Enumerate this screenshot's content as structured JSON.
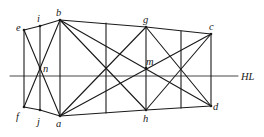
{
  "diagram": {
    "type": "perspective-construction",
    "horizon_line": {
      "label": "HL",
      "y": 76,
      "x1": 10,
      "x2": 238,
      "label_pos": [
        241,
        80
      ]
    },
    "points": {
      "e": [
        24,
        30
      ],
      "i": [
        40,
        26
      ],
      "b": [
        60,
        20
      ],
      "g": [
        146,
        27
      ],
      "c": [
        211,
        34
      ],
      "f": [
        24,
        107
      ],
      "j": [
        40,
        110
      ],
      "a": [
        60,
        116
      ],
      "h": [
        146,
        110
      ],
      "d": [
        211,
        106
      ],
      "n": [
        40,
        68
      ],
      "m": [
        146,
        68
      ]
    },
    "labels": [
      {
        "id": "e",
        "text": "e",
        "x": 16,
        "y": 31
      },
      {
        "id": "i",
        "text": "i",
        "x": 37,
        "y": 22
      },
      {
        "id": "b",
        "text": "b",
        "x": 56,
        "y": 16
      },
      {
        "id": "g",
        "text": "g",
        "x": 143,
        "y": 23
      },
      {
        "id": "c",
        "text": "c",
        "x": 209,
        "y": 30
      },
      {
        "id": "n",
        "text": "n",
        "x": 43,
        "y": 72
      },
      {
        "id": "m",
        "text": "m",
        "x": 146,
        "y": 65
      },
      {
        "id": "f",
        "text": "f",
        "x": 16,
        "y": 120
      },
      {
        "id": "j",
        "text": "j",
        "x": 37,
        "y": 125
      },
      {
        "id": "a",
        "text": "a",
        "x": 56,
        "y": 127
      },
      {
        "id": "h",
        "text": "h",
        "x": 143,
        "y": 122
      },
      {
        "id": "d",
        "text": "d",
        "x": 213,
        "y": 110
      }
    ],
    "edges": [
      [
        "e",
        "i"
      ],
      [
        "i",
        "b"
      ],
      [
        "b",
        "g"
      ],
      [
        "g",
        "c"
      ],
      [
        "f",
        "j"
      ],
      [
        "j",
        "a"
      ],
      [
        "a",
        "h"
      ],
      [
        "h",
        "d"
      ],
      [
        "e",
        "f"
      ],
      [
        "i",
        "j"
      ],
      [
        "b",
        "a"
      ],
      [
        "g",
        "h"
      ],
      [
        "c",
        "d"
      ],
      [
        "e",
        "a"
      ],
      [
        "f",
        "b"
      ],
      [
        "b",
        "h"
      ],
      [
        "a",
        "g"
      ],
      [
        "b",
        "d"
      ],
      [
        "a",
        "c"
      ],
      [
        "g",
        "d"
      ],
      [
        "h",
        "c"
      ]
    ],
    "extra_verticals": [
      {
        "x": 106,
        "y1": 23,
        "y2": 113
      },
      {
        "x": 181,
        "y1": 31,
        "y2": 108
      }
    ]
  }
}
